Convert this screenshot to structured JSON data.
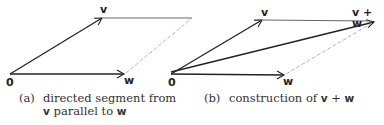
{
  "panel_a": {
    "labels": {
      "origin": "0",
      "v": "v",
      "w": "w"
    },
    "caption": {
      "tag": "(a)",
      "line1": "directed segment from",
      "line2_v": "v",
      "line2_text": " parallel to ",
      "line2_w": "w"
    }
  },
  "panel_b": {
    "labels": {
      "origin": "0",
      "v": "v",
      "w": "w",
      "sum": "v + w"
    },
    "caption": {
      "tag": "(b)",
      "text": "construction of ",
      "v": "v",
      "plus": " + ",
      "w": "w"
    }
  },
  "colors": {
    "solid": "#222222",
    "dashed": "#aaaaaa"
  }
}
